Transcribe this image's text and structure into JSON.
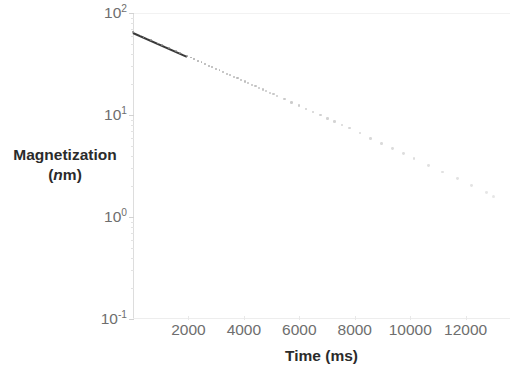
{
  "figure": {
    "background_color": "#ffffff",
    "text_color": "#6e6e6e",
    "title_color": "#2b2b2b",
    "marker_color": "#8d8d8d",
    "axis_color": "#dddddd"
  },
  "axes": {
    "y_title_line1": "Magnetization",
    "y_title_unit_italic": "n",
    "y_title_unit_rest": "m",
    "y_title_open_paren": "(",
    "y_title_close_paren": ")",
    "x_title": "Time (ms)"
  },
  "chart_data": {
    "type": "scatter",
    "title": "",
    "subtitle": "",
    "xlabel": "Time (ms)",
    "ylabel": "Magnetization (nm)",
    "yscale": "log",
    "xscale": "linear",
    "xlim": [
      0,
      13600
    ],
    "ylim": [
      0.1,
      100
    ],
    "grid": false,
    "legend": null,
    "legend_position": "none",
    "x_tick_labels": [
      "2000",
      "4000",
      "6000",
      "8000",
      "10000",
      "12000"
    ],
    "x_tick_values": [
      2000,
      4000,
      6000,
      8000,
      10000,
      12000
    ],
    "y_tick_labels": [
      "10²",
      "10¹",
      "10⁰",
      "10⁻¹"
    ],
    "y_tick_mantissa": [
      "10",
      "10",
      "10",
      "10"
    ],
    "y_tick_exponent": [
      "2",
      "1",
      "0",
      "-1"
    ],
    "y_tick_values": [
      100,
      10,
      1,
      0.1
    ],
    "series": [
      {
        "name": "Magnetization decay",
        "marker": "dot",
        "color": "#8d8d8d",
        "x": [
          0,
          130,
          260,
          390,
          520,
          650,
          780,
          910,
          1040,
          1170,
          1300,
          1430,
          1560,
          1690,
          1820,
          1950,
          2080,
          2210,
          2340,
          2470,
          2600,
          2730,
          2860,
          2990,
          3120,
          3250,
          3380,
          3510,
          3640,
          3770,
          3900,
          4030,
          4160,
          4290,
          4420,
          4550,
          4680,
          4810,
          4940,
          5070,
          5200,
          5460,
          5720,
          5980,
          6240,
          6500,
          6760,
          7020,
          7280,
          7540,
          7800,
          8190,
          8580,
          8970,
          9360,
          9750,
          10140,
          10660,
          11180,
          11700,
          12220,
          12740,
          13000
        ],
        "y": [
          65.0,
          62.7,
          60.5,
          58.3,
          56.3,
          54.3,
          52.4,
          50.5,
          48.7,
          47.0,
          45.4,
          43.7,
          42.2,
          40.7,
          39.3,
          37.9,
          36.6,
          35.3,
          34.0,
          32.8,
          31.7,
          30.5,
          29.5,
          28.4,
          27.4,
          26.4,
          25.5,
          24.6,
          23.7,
          22.9,
          22.1,
          21.3,
          20.5,
          19.8,
          19.1,
          18.4,
          17.8,
          17.1,
          16.5,
          16.0,
          15.4,
          14.3,
          13.3,
          12.4,
          11.5,
          10.7,
          9.95,
          9.25,
          8.6,
          8.0,
          7.44,
          6.64,
          5.93,
          5.29,
          4.72,
          4.21,
          3.76,
          3.22,
          2.76,
          2.37,
          2.03,
          1.74,
          1.6
        ],
        "note": "single exponential decay, approximately M(t) = 65 * exp(-t/3500)"
      },
      {
        "name": "Fit line (dense early points)",
        "marker": "line",
        "color": "#3a3a3a",
        "x_start": 0,
        "x_end": 1950,
        "y_start": 65.0,
        "y_end": 37.9
      }
    ],
    "last_point": {
      "x": 13000,
      "y": 0.65
    },
    "first_point": {
      "x": 0,
      "y": 65.0
    }
  }
}
